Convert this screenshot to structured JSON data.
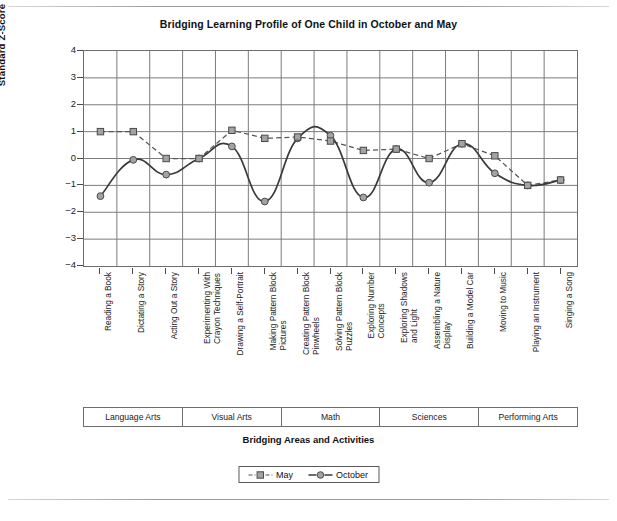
{
  "chart_data": {
    "type": "line",
    "title": "Bridging Learning Profile of One Child in October and May",
    "xlabel": "Bridging Areas and Activities",
    "ylabel": "Standard Z-Score",
    "ylim": [
      -4,
      4
    ],
    "yticks": [
      4,
      3,
      2,
      1,
      0,
      -1,
      -2,
      -3,
      -4
    ],
    "ytick_labels": [
      "4",
      "3",
      "2",
      "1",
      "0",
      "−1",
      "−2",
      "−3",
      "−4"
    ],
    "grid": true,
    "legend_position": "bottom-center",
    "categories": [
      "Reading a Book",
      "Dictating a Story",
      "Acting Out a Story",
      "Experimenting With Crayon Techniques",
      "Drawing a Self-Portrait",
      "Making Pattern Block Pictures",
      "Creating Pattern Block Pinwheels",
      "Solving Pattern Block Puzzles",
      "Exploring Number Concepts",
      "Exploring Shadows and Light",
      "Assembling a Nature Display",
      "Building a Model Car",
      "Moving to Music",
      "Playing an Instrument",
      "Singing a Song"
    ],
    "category_lines": [
      [
        "Reading a Book"
      ],
      [
        "Dictating a Story"
      ],
      [
        "Acting Out a Story"
      ],
      [
        "Experimenting With",
        "Crayon Techniques"
      ],
      [
        "Drawing a Self-Portrait"
      ],
      [
        "Making Pattern Block",
        "Pictures"
      ],
      [
        "Creating Pattern Block",
        "Pinwheels"
      ],
      [
        "Solving Pattern Block",
        "Puzzles"
      ],
      [
        "Exploring Number",
        "Concepts"
      ],
      [
        "Exploring Shadows",
        "and Light"
      ],
      [
        "Assembling a Nature",
        "Display"
      ],
      [
        "Building a Model Car"
      ],
      [
        "Moving to Music"
      ],
      [
        "Playing an Instrument"
      ],
      [
        "Singing a Song"
      ]
    ],
    "series": [
      {
        "name": "May",
        "marker": "square",
        "linestyle": "dashed",
        "color": "#555555",
        "values": [
          1.0,
          1.0,
          0.0,
          0.0,
          1.05,
          0.75,
          0.8,
          0.65,
          0.3,
          0.35,
          0.0,
          0.55,
          0.1,
          -1.0,
          -0.8
        ]
      },
      {
        "name": "October",
        "marker": "circle",
        "linestyle": "solid",
        "color": "#3a3a3a",
        "values": [
          -1.4,
          -0.05,
          -0.6,
          0.0,
          0.45,
          -1.6,
          0.75,
          0.85,
          -1.45,
          0.35,
          -0.9,
          0.55,
          -0.55,
          -1.0,
          -0.8
        ]
      }
    ],
    "groups": [
      {
        "label": "Language Arts",
        "span": 3
      },
      {
        "label": "Visual Arts",
        "span": 3
      },
      {
        "label": "Math",
        "span": 3
      },
      {
        "label": "Sciences",
        "span": 3
      },
      {
        "label": "Performing Arts",
        "span": 3
      }
    ]
  },
  "legend": {
    "items": [
      {
        "label": "May",
        "marker": "square-marker-icon"
      },
      {
        "label": "October",
        "marker": "circle-marker-icon"
      }
    ]
  }
}
